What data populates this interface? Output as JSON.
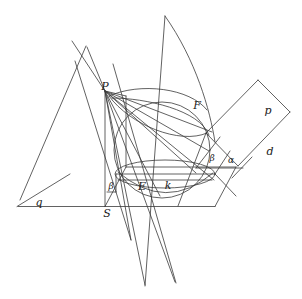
{
  "figure": {
    "kind": "geometry-diagram",
    "width": 302,
    "height": 299,
    "stroke_color": "#3a3a3a",
    "background_color": "#ffffff"
  },
  "labels": [
    {
      "id": "P",
      "text": "P",
      "x": 105,
      "y": 86,
      "size": "normal"
    },
    {
      "id": "F",
      "text": "F",
      "x": 197,
      "y": 105,
      "size": "normal"
    },
    {
      "id": "S",
      "text": "S",
      "x": 107,
      "y": 213,
      "size": "normal"
    },
    {
      "id": "E",
      "text": "E",
      "x": 142,
      "y": 186,
      "size": "normal"
    },
    {
      "id": "k",
      "text": "k",
      "x": 168,
      "y": 185,
      "size": "normal"
    },
    {
      "id": "q",
      "text": "q",
      "x": 39,
      "y": 202,
      "size": "normal"
    },
    {
      "id": "p",
      "text": "p",
      "x": 268,
      "y": 110,
      "size": "normal"
    },
    {
      "id": "d",
      "text": "d",
      "x": 270,
      "y": 151,
      "size": "normal"
    },
    {
      "id": "beta1",
      "text": "β",
      "x": 111,
      "y": 186,
      "size": "small"
    },
    {
      "id": "beta2",
      "text": "β",
      "x": 212,
      "y": 158,
      "size": "small"
    },
    {
      "id": "alpha",
      "text": "α",
      "x": 231,
      "y": 160,
      "size": "small"
    }
  ],
  "geometry": {
    "apex": {
      "x": 105,
      "y": 91
    },
    "sphere": {
      "cx": 162,
      "cy": 150,
      "r": 48
    },
    "base_plane": {
      "name": "horizontal-base-plane",
      "points": "105,206 215,206 236,167 126,167"
    },
    "vertical_plane": {
      "name": "vertical-plane",
      "points": "105,91 105,206 126,167 126,95"
    },
    "cutting_plane": {
      "name": "cutting-plane",
      "points": "206,133 258,80 290,112 238,166"
    },
    "baseline": {
      "x1": 18,
      "y1": 206,
      "x2": 215,
      "y2": 206
    },
    "line_q": {
      "x1": 18,
      "y1": 206,
      "x2": 67,
      "y2": 176
    },
    "contact_circle": {
      "cx": 165,
      "cy": 174,
      "rx": 50,
      "ry": 14
    },
    "conic_ellipse_center": {
      "cx": 166,
      "cy": 125
    }
  }
}
